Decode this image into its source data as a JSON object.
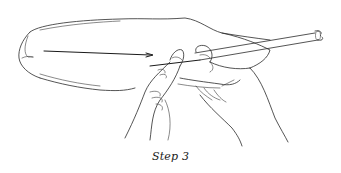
{
  "figure": {
    "caption": "Step 3",
    "illustration": {
      "subject": "two-hands-threading-needle-through-tube-into-balloon",
      "parts": [
        "balloon-body",
        "straw-tube",
        "needle-with-thread",
        "left-hand",
        "right-hand"
      ]
    }
  }
}
